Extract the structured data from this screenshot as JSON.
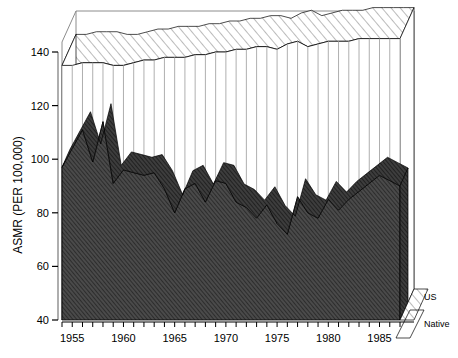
{
  "chart_data": {
    "type": "area",
    "title": "",
    "xlabel": "",
    "ylabel": "ASMR (PER 100,000)",
    "ylim": [
      40,
      148
    ],
    "xlim": [
      1954,
      1987
    ],
    "yticks": [
      40,
      60,
      80,
      100,
      120,
      140
    ],
    "xticks": [
      1955,
      1960,
      1965,
      1970,
      1975,
      1980,
      1985
    ],
    "grid": false,
    "legend_position": "right",
    "style": "3d-ribbon-area",
    "x": [
      1954,
      1955,
      1956,
      1957,
      1958,
      1959,
      1960,
      1961,
      1962,
      1963,
      1964,
      1965,
      1966,
      1967,
      1968,
      1969,
      1970,
      1971,
      1972,
      1973,
      1974,
      1975,
      1976,
      1977,
      1978,
      1979,
      1980,
      1981,
      1982,
      1983,
      1984,
      1985,
      1986,
      1987
    ],
    "series": [
      {
        "name": "Native",
        "fill": "#3a3a3a",
        "hatch": "diagonal-dense",
        "values": [
          97,
          104,
          111,
          99,
          114,
          91,
          96,
          95,
          94,
          95,
          89,
          80,
          89,
          91,
          84,
          92,
          91,
          84,
          82,
          78,
          83,
          76,
          72,
          86,
          80,
          78,
          85,
          81,
          85,
          88,
          91,
          94,
          92,
          90
        ]
      },
      {
        "name": "US",
        "fill": "#ffffff",
        "hatch": "diagonal-sparse",
        "values": [
          135,
          135,
          136,
          136,
          136,
          135,
          135,
          136,
          137,
          137,
          138,
          138,
          138,
          139,
          139,
          140,
          140,
          141,
          141,
          142,
          142,
          141,
          143,
          144,
          142,
          143,
          144,
          144,
          144,
          145,
          145,
          145,
          145,
          145
        ]
      }
    ]
  },
  "legend": {
    "items": [
      {
        "label": "US"
      },
      {
        "label": "Native"
      }
    ]
  },
  "axis": {
    "y_title": "ASMR (PER 100,000)",
    "y_tick_labels": [
      "140",
      "120",
      "100",
      "80",
      "60",
      "40"
    ],
    "x_tick_labels": [
      "1955",
      "1960",
      "1965",
      "1970",
      "1975",
      "1980",
      "1985"
    ]
  },
  "colors": {
    "native_fill": "#3a3a3a",
    "us_fill": "#ffffff",
    "line": "#000000",
    "frame": "#8c8c8c"
  }
}
